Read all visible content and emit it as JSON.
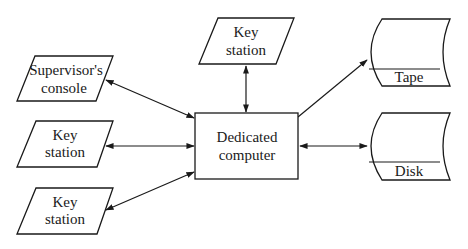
{
  "diagram": {
    "nodes": {
      "supervisor": {
        "line1": "Supervisor's",
        "line2": "console",
        "shape": "parallelogram"
      },
      "key_top": {
        "line1": "Key",
        "line2": "station",
        "shape": "parallelogram"
      },
      "key_mid": {
        "line1": "Key",
        "line2": "station",
        "shape": "parallelogram"
      },
      "key_bottom": {
        "line1": "Key",
        "line2": "station",
        "shape": "parallelogram"
      },
      "computer": {
        "line1": "Dedicated",
        "line2": "computer",
        "shape": "rectangle"
      },
      "tape": {
        "label": "Tape",
        "shape": "storage"
      },
      "disk": {
        "label": "Disk",
        "shape": "storage"
      }
    },
    "edges": [
      {
        "from": "supervisor",
        "to": "computer",
        "direction": "bidirectional"
      },
      {
        "from": "key_top",
        "to": "computer",
        "direction": "bidirectional"
      },
      {
        "from": "key_mid",
        "to": "computer",
        "direction": "bidirectional"
      },
      {
        "from": "key_bottom",
        "to": "computer",
        "direction": "bidirectional"
      },
      {
        "from": "computer",
        "to": "tape",
        "direction": "to-tape"
      },
      {
        "from": "computer",
        "to": "disk",
        "direction": "bidirectional"
      }
    ]
  }
}
